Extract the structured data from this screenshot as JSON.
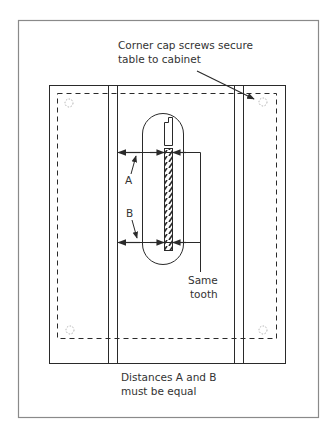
{
  "diagram": {
    "type": "table-saw top view - blade alignment check",
    "colors": {
      "line": "#2a2a2a",
      "frame": "#8a8a8a",
      "screw": "#b0b0b0",
      "text": "#333333",
      "background": "#ffffff"
    },
    "labels": {
      "corner_cap_line1": "Corner cap screws secure",
      "corner_cap_line2": "table to cabinet",
      "dim_a": "A",
      "dim_b": "B",
      "same_tooth_line1": "Same",
      "same_tooth_line2": "tooth",
      "caption_line1": "Distances A and B",
      "caption_line2": "must be equal"
    },
    "components": [
      "outer-frame",
      "table-top",
      "miter-slot-left",
      "miter-slot-right",
      "cabinet-outline-dashed",
      "corner-cap-screw-tl",
      "corner-cap-screw-tr",
      "corner-cap-screw-bl",
      "corner-cap-screw-br",
      "throat-plate",
      "riving-knife-slot",
      "saw-blade",
      "dimension-a",
      "dimension-b",
      "same-tooth-reference-line"
    ]
  }
}
